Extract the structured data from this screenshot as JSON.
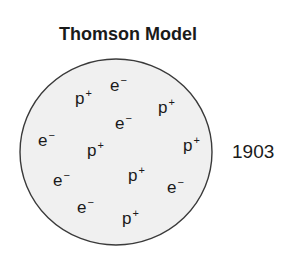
{
  "title": "Thomson Model",
  "year": "1903",
  "colors": {
    "outline": "#3a3a3a",
    "fill": "#f0f0f0",
    "text": "#1a1a1a"
  },
  "sphere": {
    "cx": 116,
    "cy": 152,
    "rx": 96,
    "ry": 93
  },
  "particles": [
    {
      "symbol": "p",
      "charge": "+",
      "type": "proton",
      "x": 75,
      "y": 104
    },
    {
      "symbol": "e",
      "charge": "−",
      "type": "electron",
      "x": 110,
      "y": 91
    },
    {
      "symbol": "p",
      "charge": "+",
      "type": "proton",
      "x": 158,
      "y": 113
    },
    {
      "symbol": "e",
      "charge": "−",
      "type": "electron",
      "x": 115,
      "y": 129
    },
    {
      "symbol": "e",
      "charge": "−",
      "type": "electron",
      "x": 38,
      "y": 146
    },
    {
      "symbol": "p",
      "charge": "+",
      "type": "proton",
      "x": 87,
      "y": 156
    },
    {
      "symbol": "p",
      "charge": "+",
      "type": "proton",
      "x": 183,
      "y": 151
    },
    {
      "symbol": "e",
      "charge": "−",
      "type": "electron",
      "x": 53,
      "y": 186
    },
    {
      "symbol": "p",
      "charge": "+",
      "type": "proton",
      "x": 128,
      "y": 181
    },
    {
      "symbol": "e",
      "charge": "−",
      "type": "electron",
      "x": 167,
      "y": 193
    },
    {
      "symbol": "e",
      "charge": "−",
      "type": "electron",
      "x": 77,
      "y": 213
    },
    {
      "symbol": "p",
      "charge": "+",
      "type": "proton",
      "x": 122,
      "y": 224
    }
  ]
}
